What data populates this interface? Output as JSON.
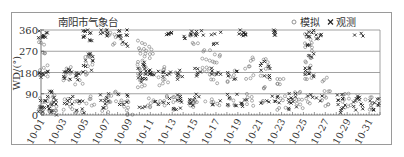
{
  "chart_data": {
    "type": "scatter",
    "title": "南阳市气象台",
    "xlabel": "",
    "ylabel": "WD/(°)",
    "ylim": [
      0,
      360
    ],
    "yticks": [
      0,
      90,
      180,
      270,
      360
    ],
    "xticks": [
      "10-01",
      "10-03",
      "10-05",
      "10-07",
      "10-09",
      "10-11",
      "10-13",
      "10-15",
      "10-17",
      "10-19",
      "10-21",
      "10-23",
      "10-25",
      "10-27",
      "10-29",
      "10-31"
    ],
    "xrange_days": [
      1,
      32
    ],
    "grid": "horizontal",
    "legend_position": "top-right",
    "legend": [
      {
        "name": "模拟",
        "marker": "circle-open"
      },
      {
        "name": "观测",
        "marker": "x"
      }
    ],
    "series": [
      {
        "name": "模拟",
        "marker": "o",
        "clusters": [
          {
            "day": 1.2,
            "values": [
              330,
              300,
              270,
              200,
              170,
              60,
              30,
              15
            ]
          },
          {
            "day": 2.0,
            "values": [
              80,
              60,
              40,
              20,
              10
            ]
          },
          {
            "day": 3.5,
            "values": [
              200,
              170,
              150,
              60,
              30
            ]
          },
          {
            "day": 4.5,
            "values": [
              170,
              140,
              60,
              20
            ]
          },
          {
            "day": 5.5,
            "values": [
              260,
              240,
              210,
              180,
              70,
              40
            ]
          },
          {
            "day": 7.0,
            "values": [
              350,
              330,
              80,
              50,
              20
            ]
          },
          {
            "day": 8.0,
            "values": [
              340,
              300,
              90,
              60
            ]
          },
          {
            "day": 9.0,
            "values": [
              60,
              30,
              10
            ]
          },
          {
            "day": 10.2,
            "values": [
              310,
              280,
              250,
              220,
              200,
              170,
              150,
              120
            ]
          },
          {
            "day": 11.0,
            "values": [
              280,
              250,
              180,
              60,
              40
            ]
          },
          {
            "day": 12.2,
            "values": [
              200,
              160,
              130,
              70,
              50
            ]
          },
          {
            "day": 13.5,
            "values": [
              170,
              80,
              60,
              30
            ]
          },
          {
            "day": 15.0,
            "values": [
              340,
              300,
              60,
              40
            ]
          },
          {
            "day": 16.2,
            "values": [
              270,
              240,
              200,
              180,
              60
            ]
          },
          {
            "day": 17.0,
            "values": [
              250,
              220,
              180,
              140,
              50
            ]
          },
          {
            "day": 18.5,
            "values": [
              180,
              150,
              70,
              40
            ]
          },
          {
            "day": 20.0,
            "values": [
              240,
              200,
              160,
              80,
              50
            ]
          },
          {
            "day": 21.5,
            "values": [
              230,
              200,
              160,
              120,
              60
            ]
          },
          {
            "day": 23.0,
            "values": [
              160,
              130,
              70,
              30
            ]
          },
          {
            "day": 24.5,
            "values": [
              90,
              60,
              40
            ]
          },
          {
            "day": 25.5,
            "values": [
              340,
              310,
              280,
              250,
              220,
              180,
              160,
              60
            ]
          },
          {
            "day": 27.0,
            "values": [
              150,
              110,
              70,
              40
            ]
          },
          {
            "day": 29.0,
            "values": [
              80,
              60,
              40
            ]
          },
          {
            "day": 31.0,
            "values": [
              70,
              50,
              30
            ]
          }
        ]
      },
      {
        "name": "观测",
        "marker": "x",
        "clusters": [
          {
            "day": 1.2,
            "values": [
              350,
              340,
              320,
              190,
              180,
              170,
              60,
              40,
              20
            ]
          },
          {
            "day": 2.0,
            "values": [
              90,
              70,
              50,
              30,
              10
            ]
          },
          {
            "day": 3.5,
            "values": [
              190,
              180,
              160,
              70,
              40
            ]
          },
          {
            "day": 4.5,
            "values": [
              180,
              160,
              50,
              20
            ]
          },
          {
            "day": 5.3,
            "values": [
              355,
              345,
              335,
              325,
              250,
              230,
              200
            ]
          },
          {
            "day": 6.8,
            "values": [
              355,
              340,
              80,
              60,
              40
            ]
          },
          {
            "day": 8.5,
            "values": [
              355,
              345,
              330,
              300,
              80,
              50
            ]
          },
          {
            "day": 10.2,
            "values": [
              220,
              200,
              180,
              160,
              150,
              40
            ]
          },
          {
            "day": 11.3,
            "values": [
              190,
              180,
              170,
              50
            ]
          },
          {
            "day": 12.5,
            "values": [
              350,
              340,
              190,
              170,
              60
            ]
          },
          {
            "day": 13.5,
            "values": [
              180,
              160,
              80,
              60,
              20
            ]
          },
          {
            "day": 14.5,
            "values": [
              350,
              330,
              60,
              40
            ]
          },
          {
            "day": 15.5,
            "values": [
              350,
              340,
              190,
              170,
              80
            ]
          },
          {
            "day": 17.0,
            "values": [
              350,
              300,
              190,
              180,
              50
            ]
          },
          {
            "day": 18.5,
            "values": [
              180,
              160,
              80,
              50
            ]
          },
          {
            "day": 19.5,
            "values": [
              355,
              345,
              340,
              60,
              40
            ]
          },
          {
            "day": 21.5,
            "values": [
              220,
              200,
              170,
              60
            ]
          },
          {
            "day": 22.5,
            "values": [
              355,
              345,
              80,
              60
            ]
          },
          {
            "day": 24.0,
            "values": [
              80,
              70,
              50,
              30
            ]
          },
          {
            "day": 25.5,
            "values": [
              355,
              340,
              300,
              250,
              200,
              180,
              170,
              80
            ]
          },
          {
            "day": 26.5,
            "values": [
              345,
              330,
              70
            ]
          },
          {
            "day": 28.5,
            "values": [
              80,
              60,
              40,
              20
            ]
          },
          {
            "day": 30.0,
            "values": [
              345,
              80,
              70,
              50,
              30
            ]
          },
          {
            "day": 31.5,
            "values": [
              70,
              50,
              30
            ]
          }
        ]
      }
    ]
  }
}
